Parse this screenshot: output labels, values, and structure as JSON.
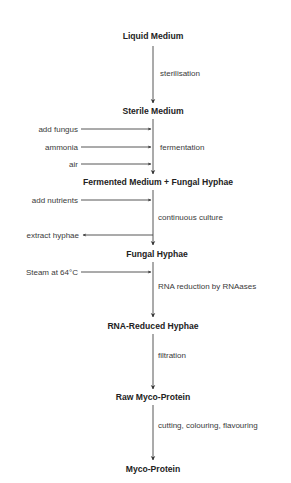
{
  "diagram": {
    "type": "process-flowchart",
    "nodes": [
      {
        "id": "liquid-medium",
        "label": "Liquid Medium"
      },
      {
        "id": "sterile-medium",
        "label": "Sterile Medium"
      },
      {
        "id": "fermented-medium",
        "label": "Fermented Medium + Fungal Hyphae"
      },
      {
        "id": "fungal-hyphae",
        "label": "Fungal Hyphae"
      },
      {
        "id": "rna-reduced-hyphae",
        "label": "RNA-Reduced Hyphae"
      },
      {
        "id": "raw-myco-protein",
        "label": "Raw Myco-Protein"
      },
      {
        "id": "myco-protein",
        "label": "Myco-Protein"
      }
    ],
    "steps": [
      {
        "from": "liquid-medium",
        "to": "sterile-medium",
        "label": "sterilisation"
      },
      {
        "from": "sterile-medium",
        "to": "fermented-medium",
        "label": "fermentation"
      },
      {
        "from": "fermented-medium",
        "to": "fungal-hyphae",
        "label": "continuous culture"
      },
      {
        "from": "fungal-hyphae",
        "to": "rna-reduced-hyphae",
        "label": "RNA reduction by RNAases"
      },
      {
        "from": "rna-reduced-hyphae",
        "to": "raw-myco-protein",
        "label": "filtration"
      },
      {
        "from": "raw-myco-protein",
        "to": "myco-protein",
        "label": "cutting, colouring, flavouring"
      }
    ],
    "inputs": [
      {
        "label": "add fungus",
        "direction": "in",
        "step": "fermentation"
      },
      {
        "label": "ammonia",
        "direction": "in",
        "step": "fermentation"
      },
      {
        "label": "air",
        "direction": "in",
        "step": "fermentation"
      },
      {
        "label": "add nutrients",
        "direction": "in",
        "step": "continuous culture"
      },
      {
        "label": "extract hyphae",
        "direction": "out",
        "step": "continuous culture"
      },
      {
        "label": "Steam at 64°C",
        "direction": "in",
        "step": "RNA reduction by RNAases"
      }
    ]
  }
}
